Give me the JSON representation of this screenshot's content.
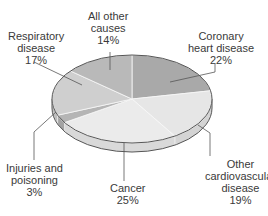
{
  "chart_data": {
    "type": "pie",
    "style": "3d",
    "title": "",
    "categories": [
      "Coronary heart disease",
      "Other cardiovascular disease",
      "Cancer",
      "Injuries and poisoning",
      "Respiratory disease",
      "All other causes"
    ],
    "values": [
      22,
      19,
      25,
      3,
      17,
      14
    ],
    "unit": "%",
    "colors": [
      "#a9a9a9",
      "#e6e6e6",
      "#ebebeb",
      "#b5b5b5",
      "#cfcfcf",
      "#b9b9b9"
    ],
    "labels": [
      {
        "line1": "Coronary",
        "line2": "heart disease",
        "pct": "22%"
      },
      {
        "line1": "Other",
        "line2": "cardiovascular",
        "line3": "disease",
        "pct": "19%"
      },
      {
        "line1": "Cancer",
        "pct": "25%"
      },
      {
        "line1": "Injuries and",
        "line2": "poisoning",
        "pct": "3%"
      },
      {
        "line1": "Respiratory",
        "line2": "disease",
        "pct": "17%"
      },
      {
        "line1": "All other",
        "line2": "causes",
        "pct": "14%"
      }
    ],
    "legend": "none (direct labels with leader lines)"
  }
}
